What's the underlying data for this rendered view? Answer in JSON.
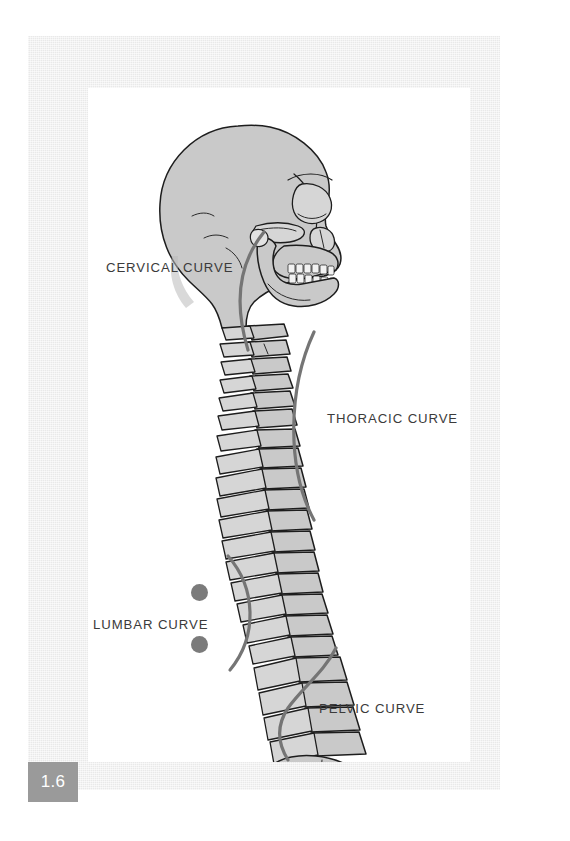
{
  "figure": {
    "number": "1.6",
    "background_color": "#ffffff",
    "mat_color": "#e9e9e9",
    "panel_color": "#ffffff",
    "badge_color": "#9a9a9a",
    "badge_text_color": "#ffffff"
  },
  "illustration": {
    "subject": "lateral view of human skull and vertebral column",
    "bone_fill": "#c9c9c9",
    "bone_fill_light": "#dcdcdc",
    "bone_outline": "#1d1d1d",
    "shadow": "#8d8d8d"
  },
  "annotations": {
    "arc_color": "#757575",
    "arc_width": 3.2,
    "label_color": "#3b3b3b",
    "dot_color": "#7b7b7b",
    "items": [
      {
        "id": "cervical",
        "label": "CERVICAL CURVE",
        "side": "left",
        "dots": 0
      },
      {
        "id": "thoracic",
        "label": "THORACIC CURVE",
        "side": "right",
        "dots": 0
      },
      {
        "id": "lumbar",
        "label": "LUMBAR CURVE",
        "side": "left",
        "dots": 2
      },
      {
        "id": "pelvic",
        "label": "PELVIC CURVE",
        "side": "right",
        "dots": 0
      }
    ]
  }
}
